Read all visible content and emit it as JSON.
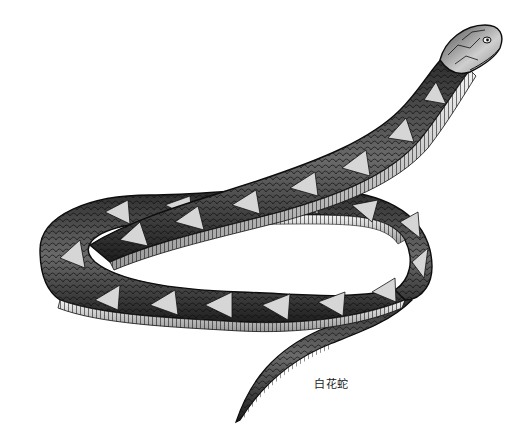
{
  "figure": {
    "caption": "白花蛇",
    "style": "black-and-white engraving",
    "colors": {
      "background": "#ffffff",
      "ink": "#111111",
      "body_dark": "#3a3a3a",
      "body_mid": "#7a7a7a",
      "highlight": "#d8d8d8",
      "belly": "#e8e8e8"
    }
  }
}
